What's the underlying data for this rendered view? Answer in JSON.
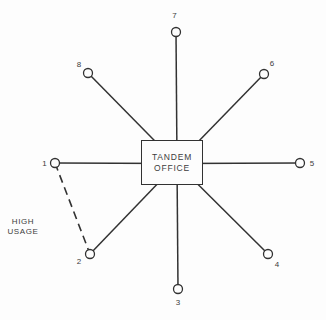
{
  "figure": {
    "background": "#fdfdfd",
    "line_color": "#323232",
    "text_color": "#3c3c3c",
    "office_box": {
      "line1": "TANDEM",
      "line2": "OFFICE",
      "x": 141,
      "y": 140,
      "width": 62,
      "height": 45
    },
    "hub": {
      "x": 177,
      "y": 163.5
    },
    "node_radius": 4.5,
    "spoke_stroke_width": 1.5,
    "nodes": [
      {
        "id": "1",
        "label": "1",
        "cx": 55,
        "cy": 163,
        "lx": 44.5,
        "ly": 166
      },
      {
        "id": "2",
        "label": "2",
        "cx": 90,
        "cy": 254,
        "lx": 79,
        "ly": 264
      },
      {
        "id": "3",
        "label": "3",
        "cx": 178,
        "cy": 289,
        "lx": 178,
        "ly": 305
      },
      {
        "id": "4",
        "label": "4",
        "cx": 268,
        "cy": 254,
        "lx": 277,
        "ly": 267
      },
      {
        "id": "5",
        "label": "5",
        "cx": 300,
        "cy": 163,
        "lx": 312,
        "ly": 166
      },
      {
        "id": "6",
        "label": "6",
        "cx": 264,
        "cy": 74,
        "lx": 272,
        "ly": 66
      },
      {
        "id": "7",
        "label": "7",
        "cx": 176,
        "cy": 32,
        "lx": 174.5,
        "ly": 18
      },
      {
        "id": "8",
        "label": "8",
        "cx": 88,
        "cy": 73,
        "lx": 79,
        "ly": 67
      }
    ],
    "links": [
      {
        "from": "1",
        "to": "2",
        "style": "dashed",
        "dash": "8 5"
      }
    ],
    "high_usage_label": {
      "line1": "HIGH",
      "line2": "USAGE",
      "x": 2,
      "y": 217,
      "width": 42
    }
  }
}
